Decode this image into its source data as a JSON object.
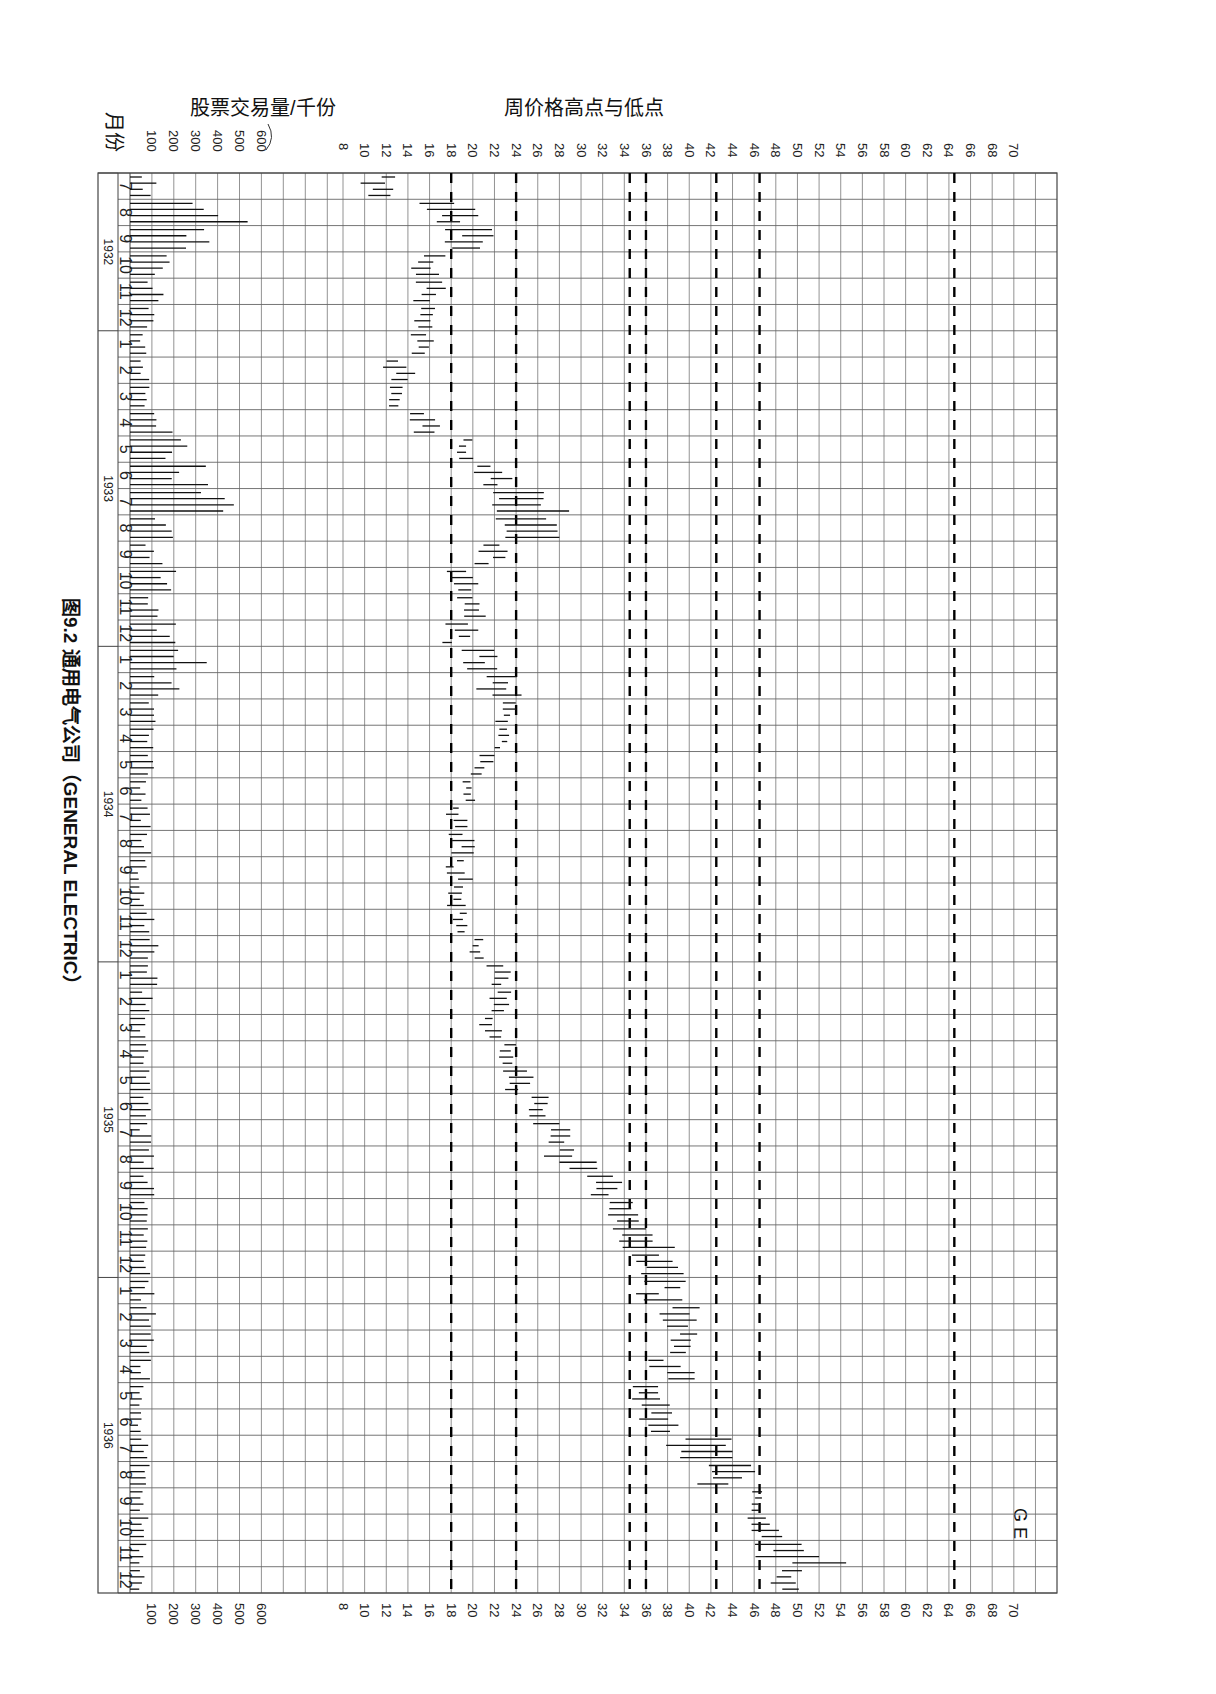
{
  "chart_data": {
    "type": "bar",
    "title": "图9.2 通用电气公司（GENERAL ELECTRIC）",
    "stock_label": "G E",
    "volume_axis": {
      "label": "股票交易量/千份",
      "ticks": [
        100,
        200,
        300,
        400,
        500,
        600
      ],
      "range": [
        0,
        700
      ]
    },
    "price_axis": {
      "label": "周价格高点与低点",
      "ticks": [
        8,
        10,
        12,
        14,
        16,
        18,
        20,
        22,
        24,
        26,
        28,
        30,
        32,
        34,
        36,
        38,
        40,
        42,
        44,
        46,
        48,
        50,
        52,
        54,
        56,
        58,
        60,
        62,
        64,
        66,
        68,
        70
      ],
      "range": [
        6,
        72
      ],
      "reference_lines": [
        18,
        24,
        34.5,
        36,
        42.5,
        46.5,
        64.5
      ]
    },
    "month_axis_label": "月份",
    "years": [
      {
        "year": "1932",
        "start_index": 0,
        "months": 6
      },
      {
        "year": "1933",
        "start_index": 6,
        "months": 12
      },
      {
        "year": "1934",
        "start_index": 18,
        "months": 12
      },
      {
        "year": "1935",
        "start_index": 30,
        "months": 12
      },
      {
        "year": "1936",
        "start_index": 42,
        "months": 12
      }
    ],
    "categories": [
      "7",
      "8",
      "9",
      "10",
      "11",
      "12",
      "1",
      "2",
      "3",
      "4",
      "5",
      "6",
      "7",
      "8",
      "9",
      "10",
      "11",
      "12",
      "1",
      "2",
      "3",
      "4",
      "5",
      "6",
      "7",
      "8",
      "9",
      "10",
      "11",
      "12",
      "1",
      "2",
      "3",
      "4",
      "5",
      "6",
      "7",
      "8",
      "9",
      "10",
      "11",
      "12",
      "1",
      "2",
      "3",
      "4",
      "5",
      "6",
      "7",
      "8",
      "9",
      "10",
      "11",
      "12"
    ],
    "series": [
      {
        "name": "monthly_low",
        "values": [
          9.5,
          14,
          16,
          14,
          14,
          14,
          14,
          11.5,
          12,
          14,
          18.5,
          20,
          20,
          20,
          20,
          17,
          18.5,
          17,
          18.5,
          20,
          22,
          22,
          19.5,
          19,
          17.5,
          17.5,
          17.5,
          17.5,
          18,
          19.5,
          21,
          21,
          20.5,
          22,
          22,
          24.5,
          25.5,
          26.5,
          30,
          31.5,
          32.5,
          34,
          35,
          36,
          37.5,
          36,
          34,
          34.5,
          35.5,
          40,
          45.5,
          45,
          45.5,
          47
        ]
      },
      {
        "name": "monthly_high",
        "values": [
          14,
          20.5,
          22.5,
          18.5,
          17.5,
          16.5,
          16.5,
          15,
          15,
          18.5,
          21,
          24.5,
          30,
          28,
          24,
          20.5,
          21.5,
          20.5,
          23,
          24.5,
          24,
          23.5,
          22,
          20.5,
          19.5,
          20.5,
          20,
          20,
          20,
          21,
          23.5,
          24,
          23,
          24.5,
          26,
          27,
          29,
          31.5,
          34.5,
          36,
          40,
          40,
          40.5,
          41.5,
          41,
          40.5,
          38.5,
          39,
          44,
          48,
          47,
          49,
          54.5,
          50.5
        ]
      },
      {
        "name": "avg_weekly_volume_thousands",
        "values": [
          90,
          390,
          270,
          160,
          110,
          80,
          60,
          70,
          90,
          180,
          260,
          300,
          480,
          160,
          110,
          160,
          130,
          150,
          260,
          180,
          90,
          80,
          80,
          70,
          80,
          70,
          60,
          60,
          90,
          100,
          100,
          80,
          70,
          70,
          80,
          70,
          70,
          100,
          100,
          80,
          90,
          80,
          80,
          90,
          80,
          70,
          50,
          40,
          60,
          70,
          50,
          70,
          60,
          50
        ]
      }
    ],
    "xlabel": "",
    "ylabel": ""
  }
}
